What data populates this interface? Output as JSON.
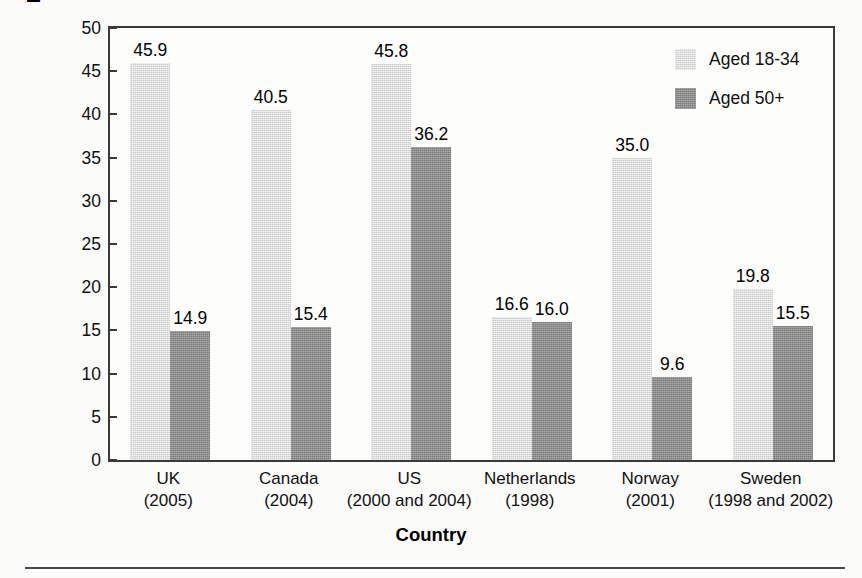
{
  "chart_data": {
    "type": "bar",
    "title": "",
    "xlabel": "Country",
    "ylabel": "Percentage point difference in\nvoter turnout",
    "ylim": [
      0,
      50
    ],
    "yticks": [
      0,
      5,
      10,
      15,
      20,
      25,
      30,
      35,
      40,
      45,
      50
    ],
    "ytick_labels": [
      "0",
      "5",
      "10",
      "15",
      "20",
      "25",
      "30",
      "35",
      "40",
      "45",
      "50"
    ],
    "grid": false,
    "legend_position": "top-right",
    "categories": [
      "UK\n(2005)",
      "Canada\n(2004)",
      "US\n(2000 and 2004)",
      "Netherlands\n(1998)",
      "Norway\n(2001)",
      "Sweden\n(1998 and 2002)"
    ],
    "category_names": [
      "UK",
      "Canada",
      "US",
      "Netherlands",
      "Norway",
      "Sweden"
    ],
    "category_years": [
      "(2005)",
      "(2004)",
      "(2000 and 2004)",
      "(1998)",
      "(2001)",
      "(1998 and 2002)"
    ],
    "series": [
      {
        "name": "Aged 18-34",
        "color": "#cdcdcd",
        "values": [
          45.9,
          40.5,
          45.8,
          16.6,
          35.0,
          19.8
        ],
        "labels": [
          "45.9",
          "40.5",
          "45.8",
          "16.6",
          "35.0",
          "19.8"
        ]
      },
      {
        "name": "Aged 50+",
        "color": "#7b7b7b",
        "values": [
          14.9,
          15.4,
          36.2,
          16.0,
          9.6,
          15.5
        ],
        "labels": [
          "14.9",
          "15.4",
          "36.2",
          "16.0",
          "9.6",
          "15.5"
        ]
      }
    ]
  },
  "legend": {
    "items": [
      {
        "label": "Aged 18-34",
        "swatch": "light"
      },
      {
        "label": "Aged 50+",
        "swatch": "dark"
      }
    ]
  },
  "axes": {
    "x_title": "Country",
    "y_title_line1": "Percentage point difference in",
    "y_title_line2": "voter turnout"
  },
  "colors": {
    "series_light": "#cdcdcd",
    "series_dark": "#7b7b7b",
    "axis": "#3a3a3a",
    "text": "#000000",
    "rule": "#4a4a52"
  }
}
